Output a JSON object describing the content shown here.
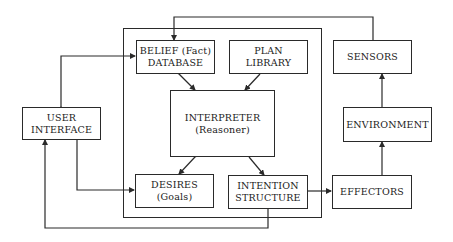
{
  "diagram": {
    "type": "architecture block diagram",
    "nodes": {
      "belief": {
        "line1": "BELIEF (Fact)",
        "line2": "DATABASE"
      },
      "plan": {
        "line1": "PLAN",
        "line2": "LIBRARY"
      },
      "sensors": {
        "line1": "SENSORS"
      },
      "user": {
        "line1": "USER",
        "line2": "INTERFACE"
      },
      "interpreter": {
        "line1": "INTERPRETER",
        "line2": "(Reasoner)"
      },
      "environment": {
        "line1": "ENVIRONMENT"
      },
      "desires": {
        "line1": "DESIRES",
        "line2": "(Goals)"
      },
      "intention": {
        "line1": "INTENTION",
        "line2": "STRUCTURE"
      },
      "effectors": {
        "line1": "EFFECTORS"
      }
    },
    "edges": [
      {
        "from": "sensors",
        "to": "belief",
        "kind": "directed"
      },
      {
        "from": "user",
        "to": "belief",
        "kind": "bidirectional"
      },
      {
        "from": "belief",
        "to": "interpreter",
        "kind": "bidirectional"
      },
      {
        "from": "plan",
        "to": "interpreter",
        "kind": "directed"
      },
      {
        "from": "interpreter",
        "to": "desires",
        "kind": "bidirectional"
      },
      {
        "from": "interpreter",
        "to": "intention",
        "kind": "directed"
      },
      {
        "from": "user",
        "to": "desires",
        "kind": "directed"
      },
      {
        "from": "intention",
        "to": "effectors",
        "kind": "directed"
      },
      {
        "from": "effectors",
        "to": "environment",
        "kind": "directed"
      },
      {
        "from": "environment",
        "to": "sensors",
        "kind": "directed"
      },
      {
        "from": "intention",
        "to": "user",
        "kind": "directed"
      }
    ]
  }
}
